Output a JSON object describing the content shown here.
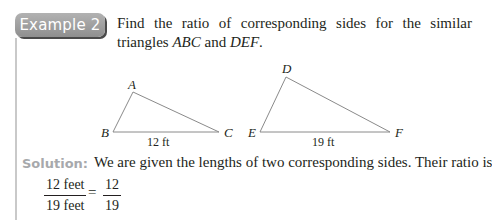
{
  "example": {
    "badge_label": "Example 2",
    "prompt_text": "Find the ratio of corresponding sides for the similar triangles",
    "prompt_tri1": "ABC",
    "prompt_and": " and ",
    "prompt_tri2": "DEF",
    "prompt_end": "."
  },
  "figure": {
    "triangle_abc": {
      "vertices": {
        "A": "A",
        "B": "B",
        "C": "C"
      },
      "side_label": "12 ft"
    },
    "triangle_def": {
      "vertices": {
        "D": "D",
        "E": "E",
        "F": "F"
      },
      "side_label": "19 ft"
    },
    "line_color": "#8a8a8a"
  },
  "solution": {
    "label": "Solution:",
    "text": "We are given the lengths of two corresponding sides. Their ratio is",
    "lhs_numerator": "12 feet",
    "lhs_denominator": "19 feet",
    "equals": "=",
    "rhs_numerator": "12",
    "rhs_denominator": "19"
  }
}
